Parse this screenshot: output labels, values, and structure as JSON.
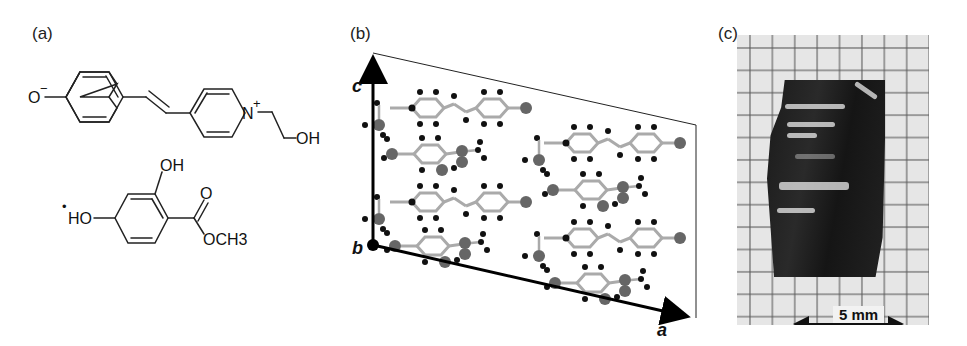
{
  "figure": {
    "panels": [
      {
        "id": "a",
        "label": "(a)",
        "content": "chemical structures",
        "molecule_1": {
          "atoms": {
            "phenolate_O": "O",
            "phenolate_charge": "−",
            "pyridinium_N": "N",
            "pyridinium_charge": "+",
            "hydroxyl": "OH"
          }
        },
        "molecule_2": {
          "prefix_dot": "•",
          "atoms": {
            "hydroxyl_para": "HO",
            "hydroxyl_ortho": "OH",
            "carbonyl_O": "O",
            "ester": "OCH3"
          }
        }
      },
      {
        "id": "b",
        "label": "(b)",
        "content": "crystal packing diagram",
        "axes": {
          "c": "c",
          "b": "b",
          "a": "a"
        }
      },
      {
        "id": "c",
        "label": "(c)",
        "content": "photograph of crystal on graph paper",
        "scale_bar": "5 mm"
      }
    ]
  }
}
